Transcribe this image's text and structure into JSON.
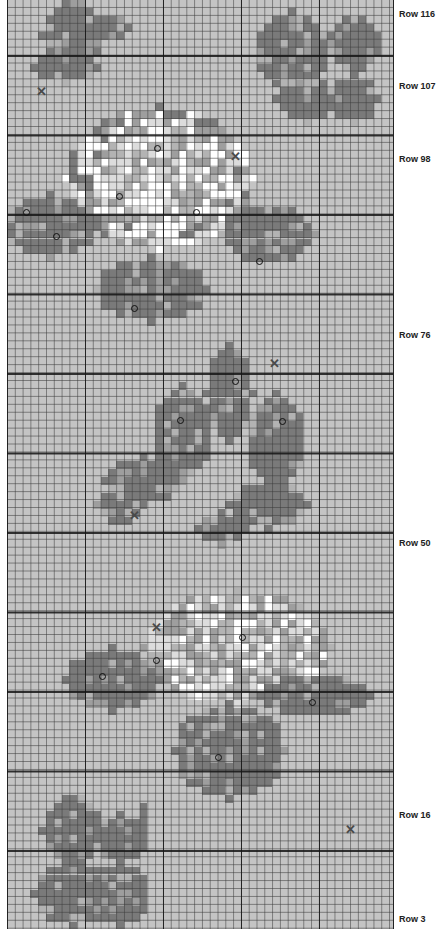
{
  "chart_data": {
    "type": "cross-stitch-pattern",
    "title": "",
    "grid": {
      "columns": 50,
      "rows": 117,
      "cell_px": [
        7.8,
        7.95
      ],
      "thick_line_every": 10,
      "background_color": "#c4c4c4"
    },
    "row_labels": [
      {
        "label": "Row 116",
        "y": 14
      },
      {
        "label": "Row 107",
        "y": 86
      },
      {
        "label": "Row 98",
        "y": 159
      },
      {
        "label": "Row 76",
        "y": 335
      },
      {
        "label": "Row 50",
        "y": 543
      },
      {
        "label": "Row 16",
        "y": 815
      },
      {
        "label": "Row 3",
        "y": 919
      }
    ],
    "palette": {
      "bg": "#c4c4c4",
      "dark": "#7a7a7a",
      "mid": "#9e9e9e",
      "light": "#b3b3b3",
      "pale": "#dcdcdc",
      "white": "#ffffff"
    },
    "motifs": [
      {
        "name": "top-left-bud",
        "rect": [
          3,
          0,
          12,
          11
        ]
      },
      {
        "name": "top-right-butterfly",
        "rect": [
          31,
          2,
          49,
          17
        ]
      },
      {
        "name": "upper-rose",
        "rect": [
          1,
          15,
          38,
          40
        ]
      },
      {
        "name": "center-leaves",
        "rect": [
          10,
          45,
          42,
          69
        ]
      },
      {
        "name": "lower-rose",
        "rect": [
          11,
          74,
          49,
          101
        ]
      },
      {
        "name": "bottom-left-butterfly",
        "rect": [
          3,
          98,
          18,
          117
        ]
      }
    ],
    "symbols": [
      {
        "type": "cross",
        "x": 41,
        "y": 92
      },
      {
        "type": "circle",
        "x": 157,
        "y": 148
      },
      {
        "type": "cross",
        "x": 235,
        "y": 157
      },
      {
        "type": "circle",
        "x": 119,
        "y": 196
      },
      {
        "type": "circle",
        "x": 26,
        "y": 212
      },
      {
        "type": "circle",
        "x": 196,
        "y": 212
      },
      {
        "type": "circle",
        "x": 56,
        "y": 236
      },
      {
        "type": "circle",
        "x": 259,
        "y": 261
      },
      {
        "type": "circle",
        "x": 134,
        "y": 308
      },
      {
        "type": "cross",
        "x": 274,
        "y": 364
      },
      {
        "type": "circle",
        "x": 235,
        "y": 381
      },
      {
        "type": "circle",
        "x": 180,
        "y": 420
      },
      {
        "type": "circle",
        "x": 282,
        "y": 421
      },
      {
        "type": "cross",
        "x": 134,
        "y": 516
      },
      {
        "type": "cross",
        "x": 156,
        "y": 628
      },
      {
        "type": "circle",
        "x": 242,
        "y": 637
      },
      {
        "type": "circle",
        "x": 156,
        "y": 660
      },
      {
        "type": "circle",
        "x": 102,
        "y": 676
      },
      {
        "type": "circle",
        "x": 312,
        "y": 702
      },
      {
        "type": "circle",
        "x": 218,
        "y": 757
      },
      {
        "type": "cross",
        "x": 350,
        "y": 830
      }
    ]
  }
}
